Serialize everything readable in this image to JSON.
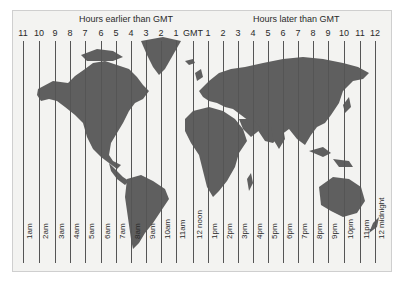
{
  "header": {
    "earlier_label": "Hours earlier than GMT",
    "later_label": "Hours later than GMT"
  },
  "top_offsets": [
    "11",
    "10",
    "9",
    "8",
    "7",
    "6",
    "5",
    "4",
    "3",
    "2",
    "1",
    "GMT",
    "1",
    "2",
    "3",
    "4",
    "5",
    "6",
    "7",
    "8",
    "9",
    "10",
    "11",
    "12"
  ],
  "bottom_times": [
    "1am",
    "2am",
    "3am",
    "4am",
    "5am",
    "6am",
    "7am",
    "8am",
    "9am",
    "10am",
    "11am",
    "12 noon",
    "1pm",
    "2pm",
    "3pm",
    "4pm",
    "5pm",
    "6pm",
    "7pm",
    "8pm",
    "9pm",
    "10pm",
    "11pm",
    "12 midnight"
  ],
  "colors": {
    "land": "#5f5f5f",
    "sea": "#f3f3f1",
    "line": "#555555",
    "text": "#2a2a2a"
  }
}
